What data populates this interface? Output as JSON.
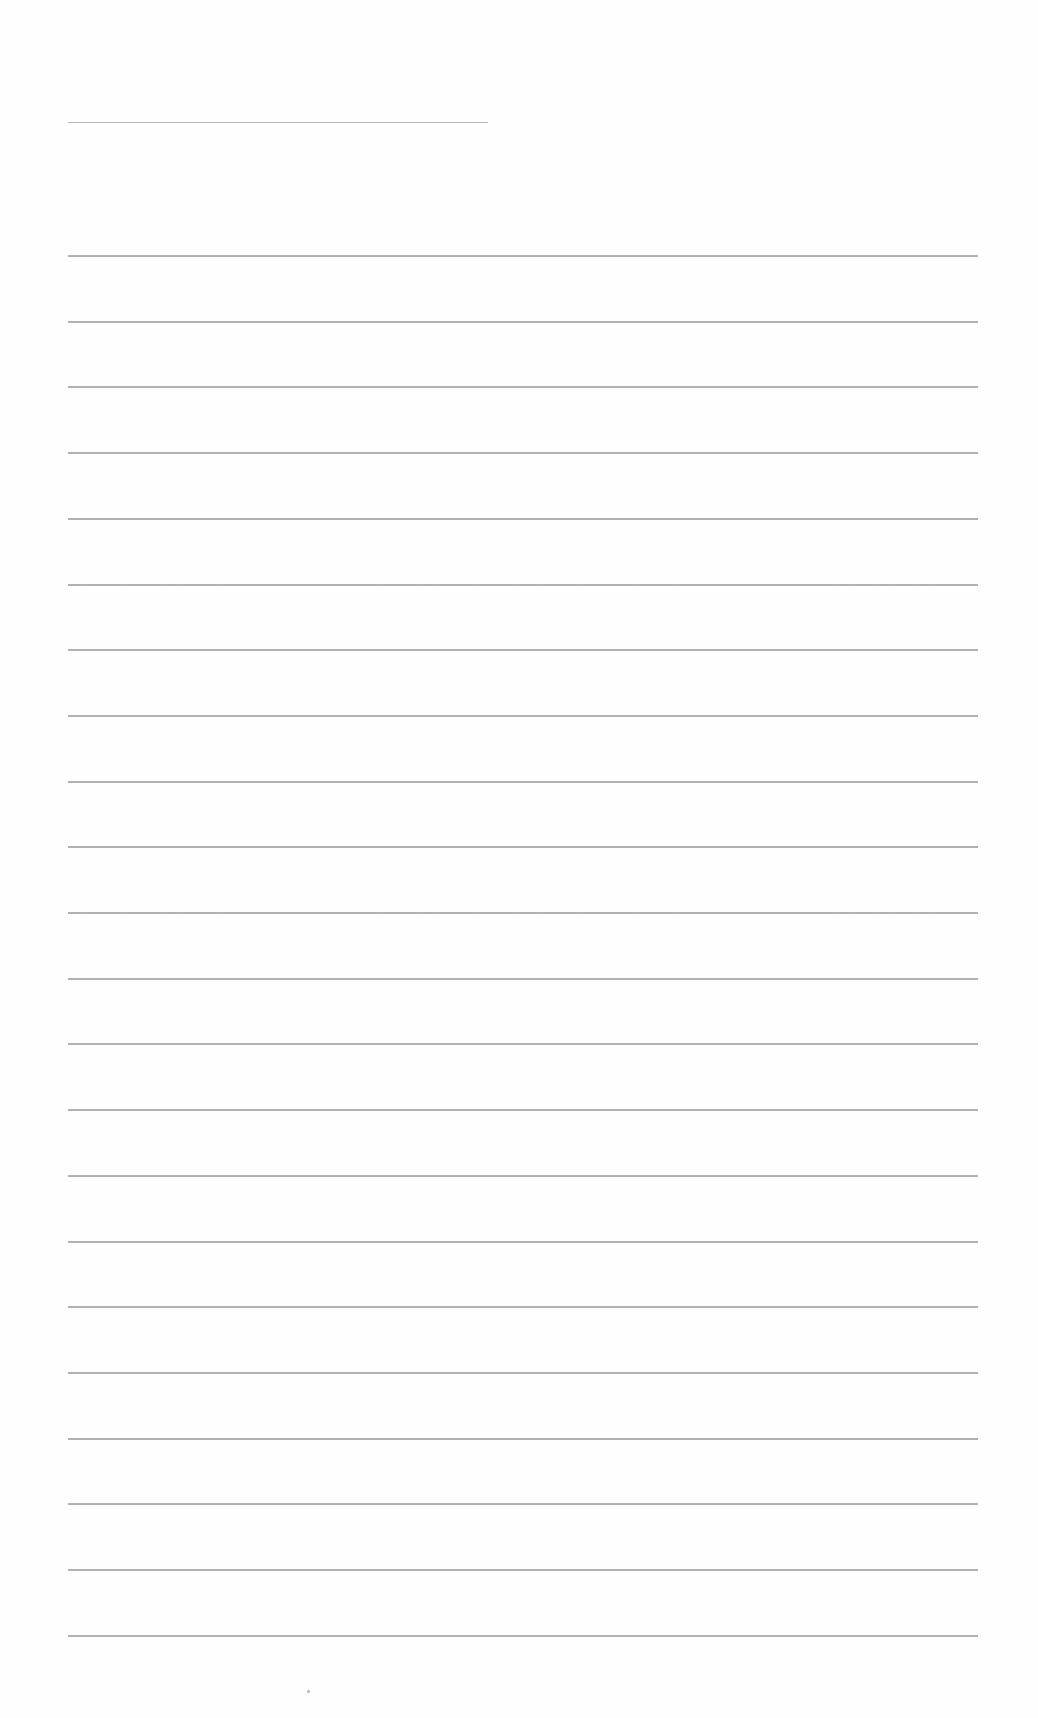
{
  "document": {
    "type": "lined-paper",
    "title_line": {
      "y": 122,
      "x_start": 68,
      "x_end": 488
    },
    "ruled_lines": {
      "count": 22,
      "first_y": 255,
      "spacing": 65.7,
      "x_start": 68,
      "x_end": 978
    },
    "line_color": "#9a9a9a",
    "background_color": "#fefefe",
    "footer_mark": {
      "x": 307,
      "y": 1690
    }
  }
}
